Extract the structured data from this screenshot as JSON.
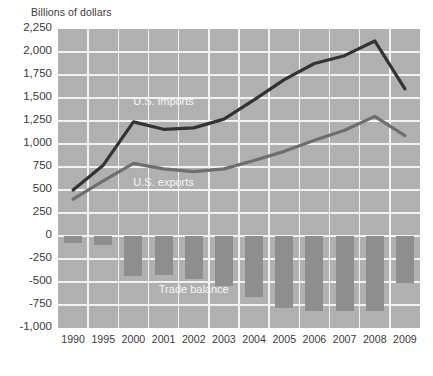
{
  "chart_data": {
    "type": "line",
    "title": "",
    "ylabel": "Billions of dollars",
    "xlabel": "",
    "ylim": [
      -1000,
      2250
    ],
    "ytick_labels": [
      "2,250",
      "2,000",
      "1,750",
      "1,500",
      "1,250",
      "1,000",
      "750",
      "500",
      "250",
      "0",
      "-250",
      "-500",
      "-750",
      "-1,000"
    ],
    "yticks": [
      2250,
      2000,
      1750,
      1500,
      1250,
      1000,
      750,
      500,
      250,
      0,
      -250,
      -500,
      -750,
      -1000
    ],
    "grid": true,
    "legend_position": "inline-annotations",
    "categories": [
      "1990",
      "1995",
      "2000",
      "2001",
      "2002",
      "2003",
      "2004",
      "2005",
      "2006",
      "2007",
      "2008",
      "2009"
    ],
    "series": [
      {
        "name": "U.S. imports",
        "type": "line",
        "color": "#333333",
        "values": [
          500,
          770,
          1240,
          1160,
          1175,
          1270,
          1480,
          1700,
          1875,
          1960,
          2120,
          1600
        ]
      },
      {
        "name": "U.S. exports",
        "type": "line",
        "color": "#6e6e6e",
        "values": [
          400,
          600,
          790,
          730,
          700,
          730,
          820,
          920,
          1040,
          1150,
          1300,
          1090
        ]
      },
      {
        "name": "Trade balance",
        "type": "bar",
        "color": "#8e8e8e",
        "values": [
          -80,
          -100,
          -440,
          -420,
          -470,
          -540,
          -660,
          -780,
          -820,
          -810,
          -820,
          -510
        ]
      }
    ],
    "annotations": [
      {
        "text": "U.S. imports",
        "x": "2001",
        "y": 1450
      },
      {
        "text": "U.S. exports",
        "x": "2001",
        "y": 560
      },
      {
        "text": "Trade balance",
        "x": "2002",
        "y": -600
      }
    ]
  },
  "colors": {
    "plot_background": "#b0b0b0",
    "gridline": "#f2f2f2",
    "imports_line": "#333333",
    "exports_line": "#6e6e6e",
    "bar_fill": "#8e8e8e",
    "text": "#3a3a3a",
    "annotation_text": "#f7f7f7"
  }
}
